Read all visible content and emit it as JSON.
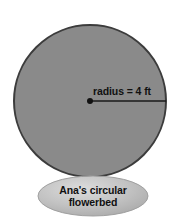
{
  "figure": {
    "background_color": "#ffffff",
    "circle": {
      "name": "flowerbed-circle",
      "fill_color": "#8a8a8a",
      "stroke_color": "#3a3a3a",
      "center_x": 90,
      "center_y": 101,
      "radius_px": 77
    },
    "radius_annotation": {
      "label": "radius = 4 ft",
      "value": 4,
      "unit": "ft",
      "line_color": "#1a1a1a",
      "dot_color": "#111111",
      "from_x": 90,
      "from_y": 101,
      "to_x": 166,
      "to_y": 101
    },
    "caption_oval": {
      "name": "caption-oval",
      "fill_color": "#bdbdbd",
      "highlight_color": "#d8d8d8",
      "edge_color": "#a2a2a2",
      "center_x": 93,
      "center_y": 196,
      "radius_x": 55,
      "radius_y": 20
    },
    "caption": {
      "line1": "Ana's circular",
      "line2": "flowerbed",
      "full_text": "Ana's circular flowerbed"
    }
  }
}
